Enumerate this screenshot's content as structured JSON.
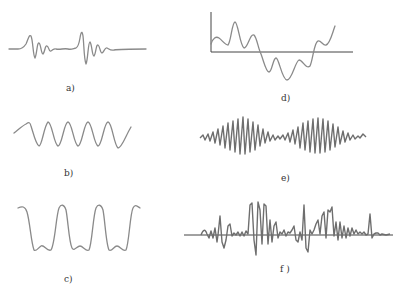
{
  "figure": {
    "panels": [
      {
        "id": "a",
        "label": "a)",
        "description": "two decaying oscillation bursts on a flat baseline"
      },
      {
        "id": "b",
        "label": "b)",
        "description": "steady sinusoid, about 6 cycles"
      },
      {
        "id": "c",
        "label": "c)",
        "description": "periodic wave with tall peaks and small double-hump troughs"
      },
      {
        "id": "d",
        "label": "d)",
        "description": "low-frequency wandering signal with axes, crossing the baseline"
      },
      {
        "id": "e",
        "label": "e)",
        "description": "amplitude-modulated high-frequency wave (beats), two envelopes"
      },
      {
        "id": "f",
        "label": "f )",
        "description": "random, noise-like transient signal about a horizontal axis"
      }
    ],
    "colors": {
      "waveform": "#8a8a8a",
      "axis": "#444444",
      "background": "#ffffff"
    }
  }
}
